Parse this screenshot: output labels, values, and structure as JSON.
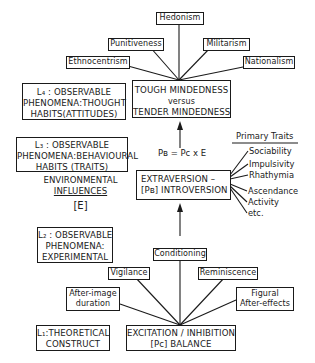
{
  "levels": {
    "l4": {
      "line1": "L₄ : OBSERVABLE",
      "line2": "PHENOMENA:THOUGHT",
      "line3": "HABITS(ATTITUDES)"
    },
    "l3": {
      "line1": "L₃ : OBSERVABLE",
      "line2": "PHENOMENA:BEHAVIOURAL",
      "line3": "HABITS (TRAITS)"
    },
    "l2": {
      "line1": "L₂ : OBSERVABLE",
      "line2": "PHENOMENA:",
      "line3": "EXPERIMENTAL"
    },
    "l1": {
      "line1": "L₁:THEORETICAL",
      "line2": "CONSTRUCT"
    }
  },
  "attitudes": {
    "hedonism": "Hedonism",
    "punitiveness": "Punitiveness",
    "militarism": "Militarism",
    "ethnocentrism": "Ethnocentrism",
    "nationalism": "Nationalism"
  },
  "tough": {
    "line1": "TOUGH MINDEDNESS",
    "line2": "versus",
    "line3": "TENDER MINDEDNESS"
  },
  "formula": "Pʙ = Pᴄ x E",
  "environment": {
    "line1": "ENVIRONMENTAL",
    "line2": "INFLUENCES",
    "line3": "[E]"
  },
  "extraversion": {
    "line1": "EXTRAVERSION –",
    "line2": "[Pʙ] INTROVERSION"
  },
  "primary_traits": {
    "title": "Primary Traits",
    "items": [
      "Sociability",
      "Impulsivity",
      "Rhathymia",
      "Ascendance",
      "Activity",
      "etc."
    ]
  },
  "experimental": {
    "conditioning": "Conditioning",
    "vigilance": "Vigilance",
    "reminiscence": "Reminiscence",
    "after_image_1": "After-image",
    "after_image_2": "duration",
    "figural_1": "Figural",
    "figural_2": "After-effects"
  },
  "excitation": {
    "line1": "EXCITATION / INHIBITION",
    "line2": "[Pᴄ]  BALANCE"
  }
}
